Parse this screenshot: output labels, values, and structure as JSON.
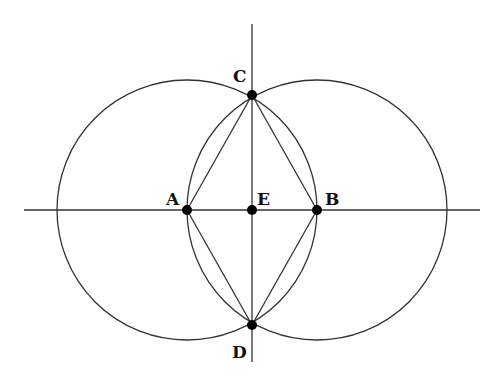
{
  "diagram": {
    "type": "geometric-construction",
    "stroke_color": "#333333",
    "point_color": "#000000",
    "points": [
      {
        "id": "A",
        "label": "A",
        "x": 187,
        "y": 210
      },
      {
        "id": "B",
        "label": "B",
        "x": 317,
        "y": 210
      },
      {
        "id": "C",
        "label": "C",
        "x": 252,
        "y": 95
      },
      {
        "id": "D",
        "label": "D",
        "x": 252,
        "y": 325
      },
      {
        "id": "E",
        "label": "E",
        "x": 252,
        "y": 210
      }
    ],
    "circles": [
      {
        "center": "A",
        "radius": 130
      },
      {
        "center": "B",
        "radius": 130
      }
    ],
    "segments": [
      [
        "A",
        "C"
      ],
      [
        "C",
        "B"
      ],
      [
        "B",
        "D"
      ],
      [
        "D",
        "A"
      ]
    ],
    "lines": [
      {
        "name": "horizontal",
        "x1": 24,
        "y1": 210,
        "x2": 480,
        "y2": 210
      },
      {
        "name": "vertical",
        "x1": 252,
        "y1": 24,
        "x2": 252,
        "y2": 362
      }
    ]
  }
}
